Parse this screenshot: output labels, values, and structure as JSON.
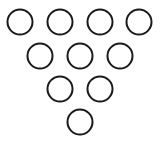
{
  "diagram": {
    "title": "",
    "stroke_color": "#1a1a1a",
    "fill_color": "#ffffff",
    "stroke_width": 2,
    "radius": 12.5,
    "rows": [
      {
        "y": 22,
        "xs": [
          20,
          60,
          100,
          139
        ]
      },
      {
        "y": 56,
        "xs": [
          40,
          80,
          120
        ]
      },
      {
        "y": 89,
        "xs": [
          60,
          100
        ]
      },
      {
        "y": 122,
        "xs": [
          80
        ]
      }
    ]
  }
}
